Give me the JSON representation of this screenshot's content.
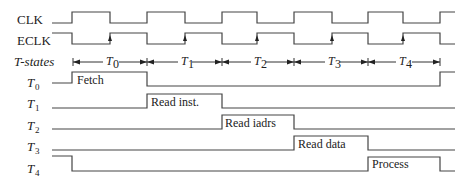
{
  "diagram": {
    "type": "timing-diagram",
    "signals": [
      {
        "id": "clk",
        "label": "CLK",
        "italic": false,
        "subscript": ""
      },
      {
        "id": "eclk",
        "label": "ECLK",
        "italic": false,
        "subscript": ""
      },
      {
        "id": "tstates",
        "label": "T-states",
        "italic": true,
        "subscript": ""
      },
      {
        "id": "t0",
        "label": "T",
        "italic": true,
        "subscript": "0"
      },
      {
        "id": "t1",
        "label": "T",
        "italic": true,
        "subscript": "1"
      },
      {
        "id": "t2",
        "label": "T",
        "italic": true,
        "subscript": "2"
      },
      {
        "id": "t3",
        "label": "T",
        "italic": true,
        "subscript": "3"
      },
      {
        "id": "t4",
        "label": "T",
        "italic": true,
        "subscript": "4"
      }
    ],
    "t_state_intervals": [
      {
        "label": "T",
        "subscript": "0"
      },
      {
        "label": "T",
        "subscript": "1"
      },
      {
        "label": "T",
        "subscript": "2"
      },
      {
        "label": "T",
        "subscript": "3"
      },
      {
        "label": "T",
        "subscript": "4"
      }
    ],
    "active_phase_labels": {
      "t0": "Fetch",
      "t1": "Read inst.",
      "t2": "Read iadrs",
      "t3": "Read data",
      "t4": "Process"
    }
  }
}
